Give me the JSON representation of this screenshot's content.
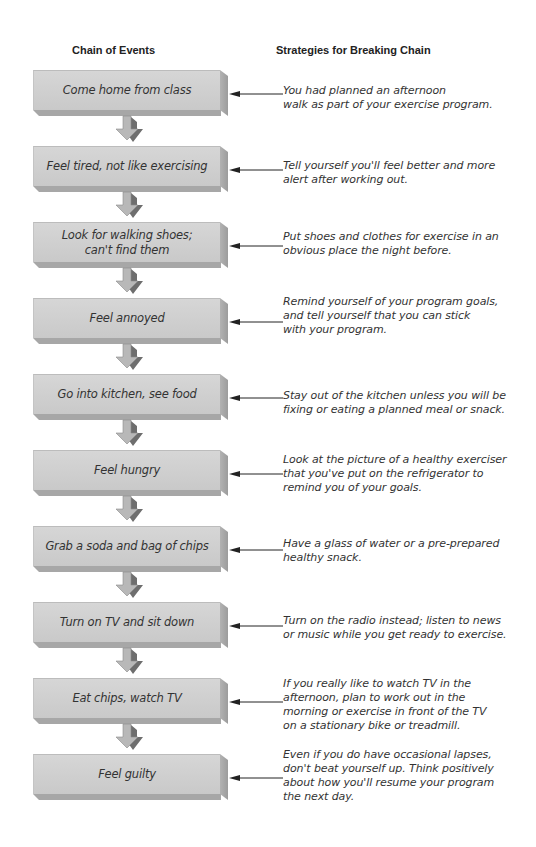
{
  "headers": {
    "chain": "Chain of Events",
    "strategies": "Strategies for Breaking Chain"
  },
  "rows": [
    {
      "event": "Come home from class",
      "strategy": [
        "You had planned an afternoon",
        "walk as part of your exercise program."
      ]
    },
    {
      "event": "Feel tired, not like exercising",
      "strategy": [
        "Tell yourself you'll feel better and more",
        "alert after working out."
      ]
    },
    {
      "event": "Look for walking shoes; can't find them",
      "event_lines": [
        "Look for walking shoes;",
        "can't find them"
      ],
      "strategy": [
        "Put shoes and clothes for exercise in an",
        "obvious place the night before."
      ]
    },
    {
      "event": "Feel annoyed",
      "strategy": [
        "Remind yourself of your program goals,",
        "and tell yourself that you can stick",
        "with your program."
      ]
    },
    {
      "event": "Go into kitchen, see food",
      "strategy": [
        "Stay out of the kitchen unless you will be",
        "fixing or eating a planned meal or snack."
      ]
    },
    {
      "event": "Feel hungry",
      "strategy": [
        "Look at the picture of a healthy exerciser",
        "that you've put on the refrigerator to",
        "remind you of your goals."
      ]
    },
    {
      "event": "Grab a soda and bag of chips",
      "strategy": [
        "Have a glass of water or a pre-prepared",
        "healthy snack."
      ]
    },
    {
      "event": "Turn on TV and sit down",
      "strategy": [
        "Turn on the radio instead; listen to news",
        "or music while you get ready to exercise."
      ]
    },
    {
      "event": "Eat chips, watch TV",
      "strategy": [
        "If you really like to watch TV in the",
        "afternoon, plan to work out in the",
        "morning or exercise in front of the TV",
        "on a stationary bike or treadmill."
      ]
    },
    {
      "event": "Feel guilty",
      "strategy": [
        "Even if you do have occasional lapses,",
        "don't beat yourself up. Think positively",
        "about how you'll resume your program",
        "the next day."
      ]
    }
  ],
  "colors": {
    "box_face": "#d0d0d0",
    "box_side": "#a8a8a8",
    "arrow_light": "#b8b8b8",
    "arrow_dark": "#6e6e6e",
    "line": "#222222"
  }
}
